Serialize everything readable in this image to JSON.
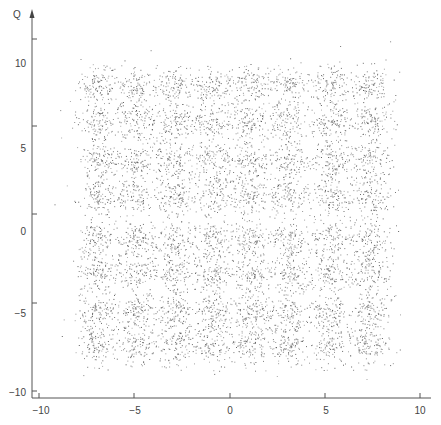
{
  "chart_data": {
    "type": "scatter",
    "title": "",
    "xlabel": "",
    "ylabel": "Q",
    "xlim": [
      -10.5,
      10.5
    ],
    "ylim": [
      -10,
      12
    ],
    "grid": false,
    "legend": null,
    "x_ticks": [
      -10,
      -5,
      0,
      5,
      10
    ],
    "y_ticks": [
      10,
      5,
      0,
      -5,
      -10
    ],
    "cluster_centers_x": [
      -7.0,
      -4.9,
      -2.9,
      -0.9,
      1.05,
      3.1,
      5.3,
      7.35
    ],
    "cluster_centers_y": [
      8.7,
      6.5,
      4.2,
      2.1,
      -0.5,
      -2.5,
      -4.8,
      -6.8
    ],
    "points_per_cluster": 120,
    "cluster_spread": 0.55,
    "point_color": "#555555",
    "axis_color": "#555555"
  },
  "axes": {
    "y_label": "Q",
    "x_tick_labels": [
      "−10",
      "−5",
      "0",
      "5",
      "10"
    ],
    "y_tick_labels": [
      "10",
      "5",
      "0",
      "−5",
      "−10"
    ]
  }
}
